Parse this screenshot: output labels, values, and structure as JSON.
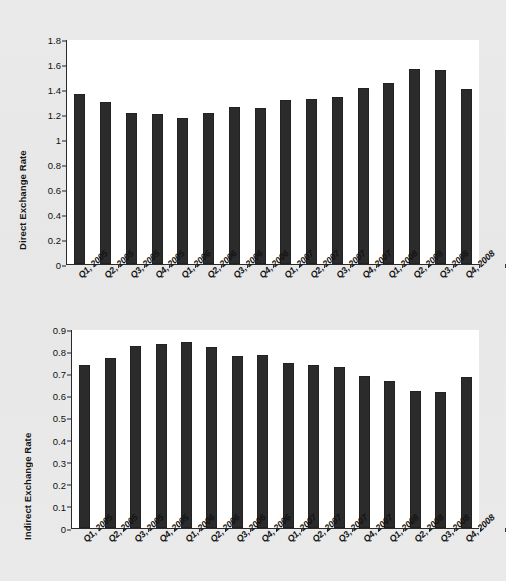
{
  "figure": {
    "background_color": "#e9e9e9",
    "plot_background_color": "#ffffff",
    "bar_color": "#2b2b2b",
    "axis_color": "#2a2a2a"
  },
  "chart_data": [
    {
      "type": "bar",
      "title": "",
      "xlabel": "",
      "ylabel": "Direct Exchange Rate",
      "ylim": [
        0,
        1.8
      ],
      "yticks": [
        0,
        0.2,
        0.4,
        0.6,
        0.8,
        1,
        1.2,
        1.4,
        1.6,
        1.8
      ],
      "ytick_labels": [
        "0",
        "0.2",
        "0.4",
        "0.6",
        "0.8",
        "1",
        "1.2",
        "1.4",
        "1.6",
        "1.8"
      ],
      "grid": false,
      "legend": false,
      "categories": [
        "Q1, 2005",
        "Q2, 2005",
        "Q3, 2005",
        "Q4, 2005",
        "Q1, 2006",
        "Q2, 2006",
        "Q3, 2006",
        "Q4, 2006",
        "Q1, 2007",
        "Q2, 2007",
        "Q3, 2007",
        "Q4, 2007",
        "Q1, 2008",
        "Q2, 2008",
        "Q3, 2008",
        "Q4, 2008"
      ],
      "values": [
        1.36,
        1.3,
        1.21,
        1.2,
        1.17,
        1.21,
        1.26,
        1.25,
        1.31,
        1.32,
        1.34,
        1.41,
        1.45,
        1.56,
        1.555,
        1.4
      ]
    },
    {
      "type": "bar",
      "title": "",
      "xlabel": "",
      "ylabel": "Indirect Exchange Rate",
      "ylim": [
        0,
        0.9
      ],
      "yticks": [
        0,
        0.1,
        0.2,
        0.3,
        0.4,
        0.5,
        0.6,
        0.7,
        0.8,
        0.9
      ],
      "ytick_labels": [
        "0",
        "0.1",
        "0.2",
        "0.3",
        "0.4",
        "0.5",
        "0.6",
        "0.7",
        "0.8",
        "0.9"
      ],
      "grid": false,
      "legend": false,
      "categories": [
        "Q1, 2005",
        "Q2, 2005",
        "Q3, 2005",
        "Q4, 2005",
        "Q1, 2006",
        "Q2, 2006",
        "Q3, 2006",
        "Q4, 2006",
        "Q1, 2007",
        "Q2, 2007",
        "Q3, 2007",
        "Q4, 2007",
        "Q1, 2008",
        "Q2, 2008",
        "Q3, 2008",
        "Q4, 2008"
      ],
      "values": [
        0.735,
        0.77,
        0.825,
        0.83,
        0.84,
        0.82,
        0.778,
        0.782,
        0.747,
        0.737,
        0.727,
        0.688,
        0.665,
        0.618,
        0.617,
        0.684
      ]
    }
  ]
}
